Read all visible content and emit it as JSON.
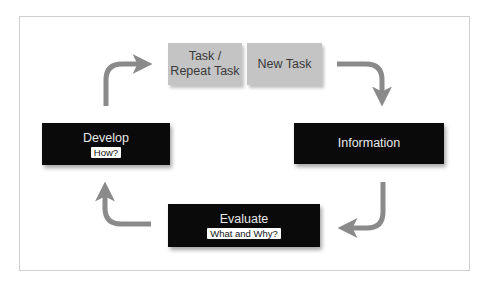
{
  "diagram": {
    "type": "cycle",
    "nodes": [
      {
        "id": "task",
        "label": "Task /\nRepeat Task",
        "line1": "Task /",
        "line2": "Repeat Task",
        "style": "grey"
      },
      {
        "id": "new_task",
        "label": "New Task",
        "style": "grey"
      },
      {
        "id": "information",
        "label": "Information",
        "style": "dark"
      },
      {
        "id": "evaluate",
        "label": "Evaluate",
        "sublabel": "What and Why?",
        "style": "dark"
      },
      {
        "id": "develop",
        "label": "Develop",
        "sublabel": "How?",
        "style": "dark"
      }
    ],
    "edges": [
      {
        "from": "new_task",
        "to": "information"
      },
      {
        "from": "information",
        "to": "evaluate"
      },
      {
        "from": "evaluate",
        "to": "develop"
      },
      {
        "from": "develop",
        "to": "task"
      }
    ]
  },
  "colors": {
    "grey_box": "#c4c4c4",
    "dark_box": "#0a0a0a",
    "arrow": "#8a8a8a",
    "frame_border": "#cfcfcf"
  }
}
